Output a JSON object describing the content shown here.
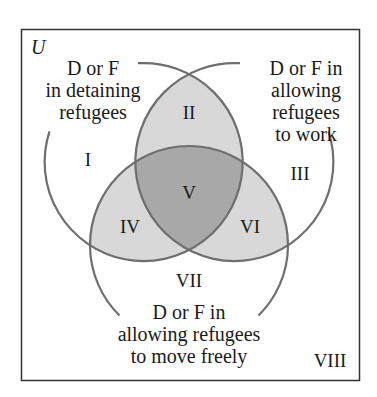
{
  "universe_label": "U",
  "sets": [
    {
      "id": "A",
      "label": "D or F\nin detaining\nrefugees"
    },
    {
      "id": "B",
      "label": "D or F in\nallowing\nrefugees\nto work"
    },
    {
      "id": "C",
      "label": "D or F in\nallowing refugees\nto move freely"
    }
  ],
  "regions": [
    {
      "id": "I",
      "label": "I"
    },
    {
      "id": "II",
      "label": "II"
    },
    {
      "id": "III",
      "label": "III"
    },
    {
      "id": "IV",
      "label": "IV"
    },
    {
      "id": "V",
      "label": "V"
    },
    {
      "id": "VI",
      "label": "VI"
    },
    {
      "id": "VII",
      "label": "VII"
    },
    {
      "id": "VIII",
      "label": "VIII"
    }
  ],
  "colors": {
    "outline": "#6e6e6e",
    "frame": "#333333",
    "shade_two_sets": "#d8d8d8",
    "shade_three_sets": "#a8a8a8",
    "background": "#ffffff"
  }
}
